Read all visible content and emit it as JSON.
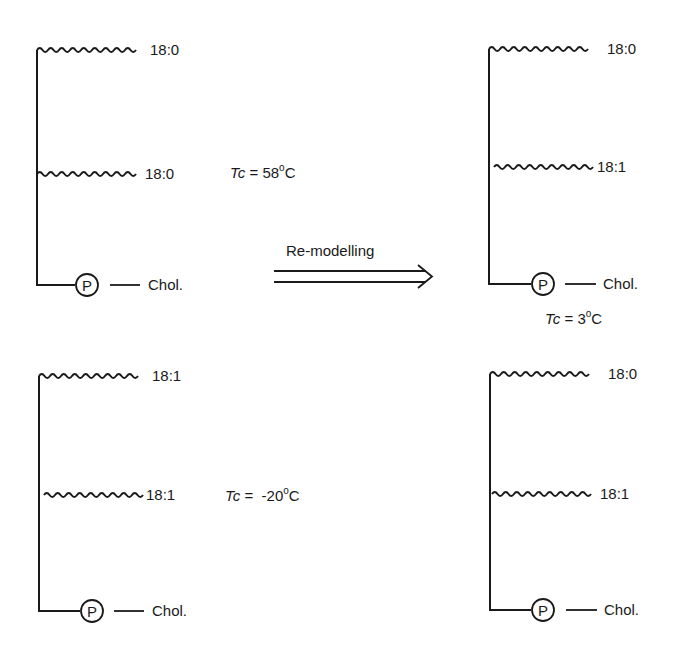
{
  "diagram": {
    "type": "phospholipid-remodelling",
    "arrow": {
      "label": "Re-modelling",
      "style": "double-arrow",
      "direction": "right"
    },
    "molecules": [
      {
        "id": "top-left",
        "chains": [
          {
            "label": "18:0"
          },
          {
            "label": "18:0"
          }
        ],
        "head": {
          "phosphate": "P",
          "group": "Chol."
        },
        "tc": {
          "prefix": "Tc",
          "equals": "=",
          "value": "58",
          "unit": "C",
          "degree": "o"
        }
      },
      {
        "id": "bottom-left",
        "chains": [
          {
            "label": "18:1"
          },
          {
            "label": "18:1"
          }
        ],
        "head": {
          "phosphate": "P",
          "group": "Chol."
        },
        "tc": {
          "prefix": "Tc",
          "equals": "=",
          "value": "-20",
          "unit": "C",
          "degree": "o"
        }
      },
      {
        "id": "top-right",
        "chains": [
          {
            "label": "18:0"
          },
          {
            "label": "18:1"
          }
        ],
        "head": {
          "phosphate": "P",
          "group": "Chol."
        },
        "tc": {
          "prefix": "Tc",
          "equals": "=",
          "value": "3",
          "unit": "C",
          "degree": "o"
        }
      },
      {
        "id": "bottom-right",
        "chains": [
          {
            "label": "18:0"
          },
          {
            "label": "18:1"
          }
        ],
        "head": {
          "phosphate": "P",
          "group": "Chol."
        }
      }
    ]
  },
  "colors": {
    "ink": "#1a1a1a",
    "background": "#ffffff"
  }
}
